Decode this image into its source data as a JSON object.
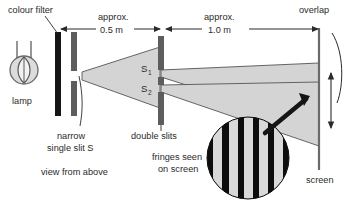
{
  "figure": {
    "background_color": "#ffffff",
    "ink_color": "#2b2b2b",
    "beam_fill": "#d4d4d4",
    "beam_stroke": "#4a4a4a",
    "barrier_color": "#5a5a5a",
    "filter_color": "#1a1a1a",
    "fringe_dark": "#0d0d0d",
    "fringe_light": "#d9d9d9"
  },
  "labels": {
    "colour_filter": "colour filter",
    "lamp": "lamp",
    "narrow_line1": "narrow",
    "narrow_line2": "single slit S",
    "double_slits": "double slits",
    "view_from_above": "view from above",
    "fringes_line1": "fringes seen",
    "fringes_line2": "on screen",
    "screen": "screen",
    "overlap": "overlap",
    "slit_1": "S",
    "slit_1_sub": "1",
    "slit_2": "S",
    "slit_2_sub": "2"
  },
  "dimensions": [
    {
      "name": "filter-to-double-slit",
      "approx_label": "approx.",
      "value_label": "0.5 m",
      "value": 0.5,
      "unit": "m"
    },
    {
      "name": "double-slit-to-screen",
      "approx_label": "approx.",
      "value_label": "1.0 m",
      "value": 1.0,
      "unit": "m"
    }
  ],
  "fringes": {
    "light_band_count": 5,
    "dark_band_count": 6,
    "description": "alternating bright and dark interference fringes"
  }
}
